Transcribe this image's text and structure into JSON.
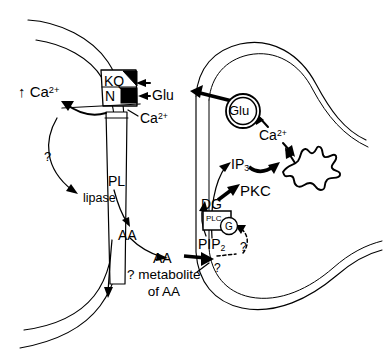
{
  "figure": {
    "background_color": "#ffffff",
    "ink_color": "#000000"
  },
  "postsynaptic": {
    "ca_influx_label": "↑ Ca",
    "ca_influx_charge": "2+",
    "receptor_kq_label": "KQ",
    "receptor_n_label": "N",
    "cleft_ca_label": "Ca",
    "cleft_ca_charge": "2+",
    "question_label": "?",
    "phospholipid_label": "PL",
    "lipase_label": "lipase",
    "arachidonic_membrane_label": "AA",
    "arachidonic_released_label": "AA",
    "metabolite_line1": "? metabolite",
    "metabolite_line2": "of AA"
  },
  "cleft": {
    "glutamate_label": "Glu"
  },
  "presynaptic": {
    "vesicle_label": "Glu",
    "calcium_label": "Ca",
    "calcium_charge": "2+",
    "ip3_label": "IP",
    "ip3_subscript": "3",
    "pkc_label": "PKC",
    "dg_label": "DG",
    "plc_label": "PLC",
    "g_protein_label": "G",
    "pip2_label": "PIP",
    "pip2_subscript": "2",
    "question_retrograde": "?",
    "question_g_protein": "?"
  }
}
